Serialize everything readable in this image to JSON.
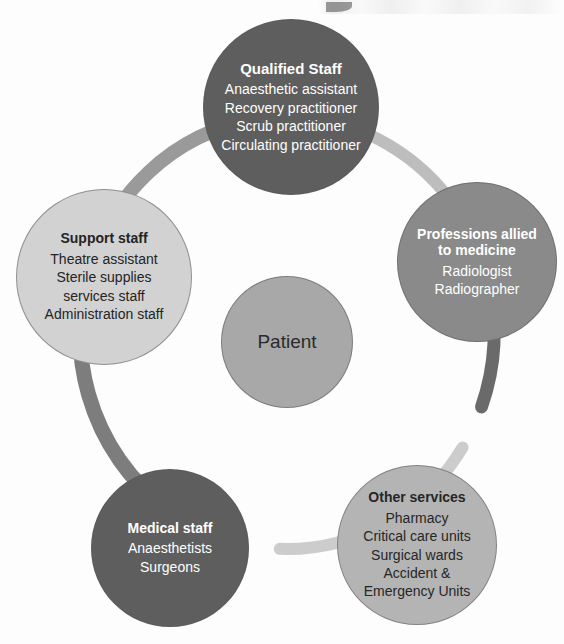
{
  "diagram": {
    "type": "ring-hub-and-spoke",
    "center": {
      "label": "Patient",
      "fill": "#a8a8a8",
      "text_color": "#2b2b2b",
      "cx": 287,
      "cy": 342,
      "r": 66
    },
    "nodes": [
      {
        "id": "qualified-staff",
        "title": "Qualified Staff",
        "items": [
          "Anaesthetic assistant",
          "Recovery practitioner",
          "Scrub practitioner",
          "Circulating practitioner"
        ],
        "fill": "#5e5e5e",
        "text_color": "#ffffff",
        "cx": 291,
        "cy": 107,
        "r": 88,
        "title_size": 15,
        "item_size": 14
      },
      {
        "id": "professions-allied-to-medicine",
        "title": "Professions allied to medicine",
        "items": [
          "Radiologist",
          "Radiographer"
        ],
        "fill": "#8a8a8a",
        "text_color": "#ffffff",
        "cx": 477,
        "cy": 262,
        "r": 80,
        "title_size": 14,
        "item_size": 14
      },
      {
        "id": "other-services",
        "title": "Other services",
        "items": [
          "Pharmacy",
          "Critical care units",
          "Surgical wards",
          "Accident &",
          "Emergency Units"
        ],
        "fill": "#b4b4b4",
        "text_color": "#262626",
        "cx": 417,
        "cy": 545,
        "r": 80,
        "title_size": 14,
        "item_size": 14
      },
      {
        "id": "medical-staff",
        "title": "Medical staff",
        "items": [
          "Anaesthetists",
          "Surgeons"
        ],
        "fill": "#5e5e5e",
        "text_color": "#ffffff",
        "cx": 170,
        "cy": 548,
        "r": 79,
        "title_size": 14,
        "item_size": 14
      },
      {
        "id": "support-staff",
        "title": "Support staff",
        "items": [
          "Theatre assistant",
          "Sterile supplies",
          "services staff",
          "Administration staff"
        ],
        "fill": "#d2d2d2",
        "text_color": "#242424",
        "cx": 104,
        "cy": 277,
        "r": 88,
        "title_size": 14,
        "item_size": 14
      }
    ],
    "ring": {
      "cx": 287,
      "cy": 333,
      "rx": 207,
      "ry": 216,
      "segments": [
        {
          "id": "support-to-qualified",
          "color": "#7d7d7d",
          "width": 15,
          "start_deg": 196,
          "end_deg": 272
        },
        {
          "id": "qualified-to-professions",
          "color": "#9a9a9a",
          "width": 14,
          "start_deg": 284,
          "end_deg": 352
        },
        {
          "id": "professions-to-other",
          "color": "#bdbdbd",
          "width": 12,
          "start_deg": 10,
          "end_deg": 62
        },
        {
          "id": "other-to-medical",
          "color": "#6a6a6a",
          "width": 13,
          "start_deg": 76,
          "end_deg": 110
        },
        {
          "id": "medical-to-support",
          "color": "#cccccc",
          "width": 12,
          "start_deg": 122,
          "end_deg": 182
        }
      ]
    }
  }
}
